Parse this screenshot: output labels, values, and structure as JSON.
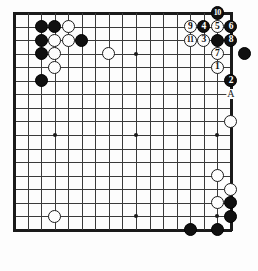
{
  "board": {
    "title": "Go board problem diagram",
    "type": "go-board",
    "cols": 17,
    "rows": 17,
    "origin_x": 14,
    "origin_y": 13,
    "spacing": 13.55,
    "stone_radius": 6.6,
    "star_points": [
      {
        "col": 3,
        "row": 3
      },
      {
        "col": 9,
        "row": 3
      },
      {
        "col": 15,
        "row": 3
      },
      {
        "col": 3,
        "row": 9
      },
      {
        "col": 9,
        "row": 9
      },
      {
        "col": 15,
        "row": 9
      },
      {
        "col": 3,
        "row": 15
      },
      {
        "col": 9,
        "row": 15
      },
      {
        "col": 15,
        "row": 15
      }
    ],
    "stones": [
      {
        "col": 2,
        "row": 1,
        "color": "black",
        "label": ""
      },
      {
        "col": 3,
        "row": 1,
        "color": "black",
        "label": ""
      },
      {
        "col": 4,
        "row": 1,
        "color": "white",
        "label": ""
      },
      {
        "col": 2,
        "row": 2,
        "color": "black",
        "label": ""
      },
      {
        "col": 3,
        "row": 2,
        "color": "white",
        "label": ""
      },
      {
        "col": 4,
        "row": 2,
        "color": "white",
        "label": ""
      },
      {
        "col": 5,
        "row": 2,
        "color": "black",
        "label": ""
      },
      {
        "col": 2,
        "row": 3,
        "color": "black",
        "label": ""
      },
      {
        "col": 3,
        "row": 3,
        "color": "white",
        "label": ""
      },
      {
        "col": 3,
        "row": 4,
        "color": "white",
        "label": ""
      },
      {
        "col": 2,
        "row": 5,
        "color": "black",
        "label": ""
      },
      {
        "col": 7,
        "row": 3,
        "color": "white",
        "label": ""
      },
      {
        "col": 13,
        "row": 1,
        "color": "white",
        "label": "9"
      },
      {
        "col": 14,
        "row": 1,
        "color": "black",
        "label": "4"
      },
      {
        "col": 15,
        "row": 1,
        "color": "white",
        "label": "5"
      },
      {
        "col": 16,
        "row": 1,
        "color": "black",
        "label": "6"
      },
      {
        "col": 15,
        "row": 0,
        "color": "black",
        "label": "10"
      },
      {
        "col": 13,
        "row": 2,
        "color": "white",
        "label": "11"
      },
      {
        "col": 14,
        "row": 2,
        "color": "white",
        "label": "3"
      },
      {
        "col": 15,
        "row": 2,
        "color": "black",
        "label": ""
      },
      {
        "col": 16,
        "row": 2,
        "color": "black",
        "label": "8"
      },
      {
        "col": 15,
        "row": 3,
        "color": "white",
        "label": "7"
      },
      {
        "col": 17,
        "row": 3,
        "color": "black",
        "label": ""
      },
      {
        "col": 15,
        "row": 4,
        "color": "white",
        "label": "1"
      },
      {
        "col": 16,
        "row": 5,
        "color": "black",
        "label": "2"
      },
      {
        "col": 16,
        "row": 8,
        "color": "white",
        "label": ""
      },
      {
        "col": 15,
        "row": 12,
        "color": "white",
        "label": ""
      },
      {
        "col": 16,
        "row": 13,
        "color": "white",
        "label": ""
      },
      {
        "col": 15,
        "row": 14,
        "color": "white",
        "label": ""
      },
      {
        "col": 16,
        "row": 14,
        "color": "black",
        "label": ""
      },
      {
        "col": 16,
        "row": 15,
        "color": "black",
        "label": ""
      },
      {
        "col": 15,
        "row": 16,
        "color": "black",
        "label": ""
      },
      {
        "col": 13,
        "row": 16,
        "color": "black",
        "label": ""
      },
      {
        "col": 3,
        "row": 15,
        "color": "white",
        "label": ""
      }
    ],
    "markers": [
      {
        "col": 16,
        "row": 6,
        "label": "A",
        "kind": "letter"
      }
    ],
    "colors": {
      "black_stone": "#101010",
      "white_stone": "#fdfdfd",
      "stone_outline": "#1b1b1b",
      "grid": "#3a3a3a",
      "border": "#1a1a1a",
      "background": "#fdfdfd",
      "black_label_text": "#ffffff",
      "white_label_text": "#101010"
    }
  }
}
